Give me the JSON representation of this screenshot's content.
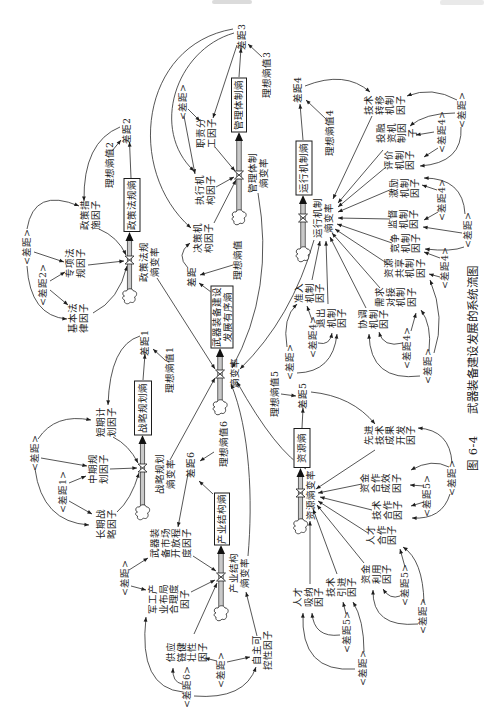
{
  "figure": {
    "number": "图 6-4",
    "title": "武器装备建设发展的系统流图"
  },
  "central": {
    "stock": "武器装备建设\n发展有序熵",
    "rate": "熵变率",
    "gap": "差距",
    "ideal": "理想熵值"
  },
  "subsystems": {
    "policy": {
      "stock": "政策法规熵",
      "rate": "政策法规\n熵变率",
      "gap": "差距2",
      "ideal": "理想熵值2",
      "factors": [
        "政策措\n施因子",
        "专项法\n规因子",
        "基本法\n律因子"
      ],
      "shadows": [
        "<差距>",
        "<差距2>"
      ]
    },
    "management": {
      "stock": "管理体制熵",
      "rate": "管理体制\n熵变率",
      "gap": "差距3",
      "ideal": "理想熵值3",
      "factors": [
        "职责分\n工因子",
        "执行机\n构因子",
        "决策机\n构因子"
      ],
      "shadows": [
        "<差距>"
      ]
    },
    "operation": {
      "stock": "运行机制熵",
      "rate": "运行机制\n熵变率",
      "gap": "差距4",
      "ideal": "理想熵值4",
      "factors": [
        "技术\n转移\n机制\n因子",
        "投融\n资机\n制因\n子",
        "评价\n机制\n因子",
        "激励\n机制\n因子",
        "监督\n机制\n因子",
        "竞争\n机制\n因子",
        "资源\n共享\n机制\n因子",
        "需求\n对接\n机制\n因子",
        "协调\n机制\n因子",
        "准入\n机制\n因子",
        "退出\n机制\n因子"
      ],
      "shadows": [
        "<差距>",
        "<差距4>",
        "<差距4>",
        "<差距>",
        "<差距4>",
        "<差距4>",
        "<差距>",
        "<差距4>",
        "<差距>"
      ]
    },
    "strategy": {
      "stock": "战略规划熵",
      "rate": "战略规划\n熵变率",
      "gap": "差距1",
      "ideal": "理想熵值1",
      "factors": [
        "短期计\n划因子",
        "中期规\n划因子",
        "长期战\n略因子"
      ],
      "shadows": [
        "<差距>",
        "<差距1>"
      ]
    },
    "industry": {
      "stock": "产业结构熵",
      "rate": "产业结构\n熵变率",
      "gap": "差距6",
      "ideal": "理想熵值6",
      "factors": [
        "武器装\n备市场\n开放程\n度因子",
        "军工产\n业布局\n合理度\n因子",
        "供应\n链健\n壮性\n因子",
        "自主可\n控性因子"
      ],
      "shadows": [
        "<差距>",
        "<差距6>",
        "<差距>"
      ]
    },
    "resource": {
      "stock": "资源熵",
      "rate": "资源熵变率",
      "gap": "差距5",
      "ideal": "理想熵值5",
      "factors": [
        "先进\n技术\n成果\n开发\n因子",
        "资金\n合作\n成效\n因子",
        "技术\n合作\n因子",
        "人才\n合作\n因子",
        "资金\n利用\n因子",
        "技术\n引进\n因子",
        "人才\n吸纳\n因子"
      ],
      "shadows": [
        "<差距>",
        "<差距5>",
        "<差距5>",
        "<差距>",
        "<差距5>",
        "<差距>"
      ]
    }
  },
  "colors": {
    "ink": "#1c1c1c",
    "pipe_fill": "#c9c9c9",
    "background": "#ffffff"
  }
}
